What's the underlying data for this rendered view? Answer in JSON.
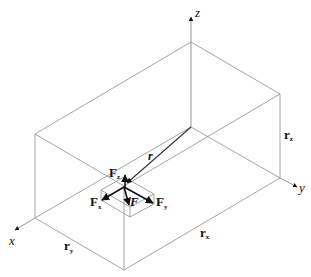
{
  "diagram": {
    "axes": [
      {
        "name": "x",
        "label": "x"
      },
      {
        "name": "y",
        "label": "y"
      },
      {
        "name": "z",
        "label": "z"
      }
    ],
    "vectors": {
      "position": {
        "label": "r"
      },
      "force": {
        "label": "F"
      },
      "force_components": [
        {
          "base": "F",
          "sub": "x"
        },
        {
          "base": "F",
          "sub": "y"
        },
        {
          "base": "F",
          "sub": "z"
        }
      ]
    },
    "dimensions": [
      {
        "base": "r",
        "sub": "x"
      },
      {
        "base": "r",
        "sub": "y"
      },
      {
        "base": "r",
        "sub": "z"
      }
    ],
    "colors": {
      "edges": "#9a9a9a",
      "vectors": "#111111",
      "background": "#ffffff"
    }
  }
}
